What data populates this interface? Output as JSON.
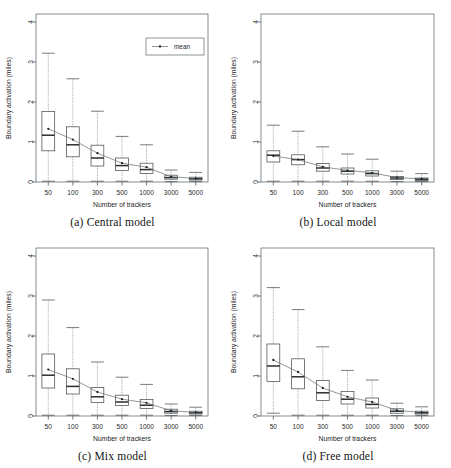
{
  "figure": {
    "panel_order": [
      "a",
      "b",
      "c",
      "d"
    ],
    "shared": {
      "xlabel": "Number of trackers",
      "ylabel": "Boundary activation (miles)",
      "xtick_labels": [
        "50",
        "100",
        "300",
        "500",
        "1000",
        "3000",
        "5000"
      ],
      "ytick_labels": [
        "0",
        "1",
        "2",
        "3",
        "4"
      ],
      "ylim": [
        0,
        4.2
      ],
      "legend_label": "mean",
      "grid": false,
      "legend_position": "top-right (panel a only)"
    }
  },
  "chart_data": [
    {
      "type": "box",
      "panel": "a",
      "title": "(a) Central model",
      "caption": "(a) Central model",
      "xlabel": "Number of trackers",
      "ylabel": "Boundary activation (miles)",
      "categories": [
        "50",
        "100",
        "300",
        "500",
        "1000",
        "3000",
        "5000"
      ],
      "ylim": [
        0,
        4.2
      ],
      "yticks": [
        0,
        1,
        2,
        3,
        4
      ],
      "grid": false,
      "legend": [
        "mean"
      ],
      "legend_position": "top-right",
      "boxes": [
        {
          "category": "50",
          "whisker_low": 0.02,
          "q1": 0.78,
          "median": 1.17,
          "q3": 1.76,
          "whisker_high": 3.22,
          "mean": 1.33
        },
        {
          "category": "100",
          "whisker_low": 0.02,
          "q1": 0.63,
          "median": 0.93,
          "q3": 1.38,
          "whisker_high": 2.58,
          "mean": 1.06
        },
        {
          "category": "300",
          "whisker_low": 0.02,
          "q1": 0.4,
          "median": 0.6,
          "q3": 0.92,
          "whisker_high": 1.77,
          "mean": 0.72
        },
        {
          "category": "500",
          "whisker_low": 0.02,
          "q1": 0.29,
          "median": 0.41,
          "q3": 0.6,
          "whisker_high": 1.14,
          "mean": 0.47
        },
        {
          "category": "1000",
          "whisker_low": 0.02,
          "q1": 0.21,
          "median": 0.31,
          "q3": 0.47,
          "whisker_high": 0.93,
          "mean": 0.37
        },
        {
          "category": "3000",
          "whisker_low": 0.01,
          "q1": 0.07,
          "median": 0.11,
          "q3": 0.17,
          "whisker_high": 0.3,
          "mean": 0.13
        },
        {
          "category": "5000",
          "whisker_low": 0.01,
          "q1": 0.05,
          "median": 0.08,
          "q3": 0.12,
          "whisker_high": 0.24,
          "mean": 0.09
        }
      ],
      "mean_series": {
        "name": "mean",
        "values": [
          1.33,
          1.06,
          0.72,
          0.47,
          0.37,
          0.13,
          0.09
        ]
      }
    },
    {
      "type": "box",
      "panel": "b",
      "title": "(b) Local model",
      "caption": "(b) Local model",
      "xlabel": "Number of trackers",
      "ylabel": "Boundary activation (miles)",
      "categories": [
        "50",
        "100",
        "300",
        "500",
        "1000",
        "3000",
        "5000"
      ],
      "ylim": [
        0,
        4.2
      ],
      "yticks": [
        0,
        1,
        2,
        3,
        4
      ],
      "grid": false,
      "legend": [],
      "boxes": [
        {
          "category": "50",
          "whisker_low": 0.02,
          "q1": 0.5,
          "median": 0.67,
          "q3": 0.78,
          "whisker_high": 1.42,
          "mean": 0.65
        },
        {
          "category": "100",
          "whisker_low": 0.02,
          "q1": 0.43,
          "median": 0.56,
          "q3": 0.68,
          "whisker_high": 1.27,
          "mean": 0.56
        },
        {
          "category": "300",
          "whisker_low": 0.02,
          "q1": 0.27,
          "median": 0.35,
          "q3": 0.46,
          "whisker_high": 0.88,
          "mean": 0.38
        },
        {
          "category": "500",
          "whisker_low": 0.02,
          "q1": 0.2,
          "median": 0.27,
          "q3": 0.35,
          "whisker_high": 0.7,
          "mean": 0.29
        },
        {
          "category": "1000",
          "whisker_low": 0.02,
          "q1": 0.15,
          "median": 0.21,
          "q3": 0.28,
          "whisker_high": 0.57,
          "mean": 0.23
        },
        {
          "category": "3000",
          "whisker_low": 0.01,
          "q1": 0.06,
          "median": 0.1,
          "q3": 0.14,
          "whisker_high": 0.27,
          "mean": 0.11
        },
        {
          "category": "5000",
          "whisker_low": 0.01,
          "q1": 0.04,
          "median": 0.07,
          "q3": 0.1,
          "whisker_high": 0.21,
          "mean": 0.08
        }
      ],
      "mean_series": {
        "name": "mean",
        "values": [
          0.65,
          0.56,
          0.38,
          0.29,
          0.23,
          0.11,
          0.08
        ]
      }
    },
    {
      "type": "box",
      "panel": "c",
      "title": "(c) Mix model",
      "caption": "(c) Mix model",
      "xlabel": "Number of trackers",
      "ylabel": "Boundary activation (miles)",
      "categories": [
        "50",
        "100",
        "300",
        "500",
        "1000",
        "3000",
        "5000"
      ],
      "ylim": [
        0,
        4.2
      ],
      "yticks": [
        0,
        1,
        2,
        3,
        4
      ],
      "grid": false,
      "legend": [],
      "boxes": [
        {
          "category": "50",
          "whisker_low": 0.02,
          "q1": 0.7,
          "median": 1.02,
          "q3": 1.55,
          "whisker_high": 2.9,
          "mean": 1.16
        },
        {
          "category": "100",
          "whisker_low": 0.02,
          "q1": 0.55,
          "median": 0.74,
          "q3": 1.18,
          "whisker_high": 2.21,
          "mean": 0.93
        },
        {
          "category": "300",
          "whisker_low": 0.02,
          "q1": 0.34,
          "median": 0.48,
          "q3": 0.71,
          "whisker_high": 1.35,
          "mean": 0.6
        },
        {
          "category": "500",
          "whisker_low": 0.02,
          "q1": 0.26,
          "median": 0.35,
          "q3": 0.52,
          "whisker_high": 0.97,
          "mean": 0.42
        },
        {
          "category": "1000",
          "whisker_low": 0.02,
          "q1": 0.19,
          "median": 0.27,
          "q3": 0.41,
          "whisker_high": 0.79,
          "mean": 0.33
        },
        {
          "category": "3000",
          "whisker_low": 0.01,
          "q1": 0.07,
          "median": 0.11,
          "q3": 0.17,
          "whisker_high": 0.3,
          "mean": 0.13
        },
        {
          "category": "5000",
          "whisker_low": 0.01,
          "q1": 0.05,
          "median": 0.08,
          "q3": 0.12,
          "whisker_high": 0.22,
          "mean": 0.09
        }
      ],
      "mean_series": {
        "name": "mean",
        "values": [
          1.16,
          0.93,
          0.6,
          0.42,
          0.33,
          0.13,
          0.09
        ]
      }
    },
    {
      "type": "box",
      "panel": "d",
      "title": "(d) Free model",
      "caption": "(d) Free model",
      "xlabel": "Number of trackers",
      "ylabel": "Boundary activation (miles)",
      "categories": [
        "50",
        "100",
        "300",
        "500",
        "1000",
        "3000",
        "5000"
      ],
      "ylim": [
        0,
        4.2
      ],
      "yticks": [
        0,
        1,
        2,
        3,
        4
      ],
      "grid": false,
      "legend": [],
      "boxes": [
        {
          "category": "50",
          "whisker_low": 0.07,
          "q1": 0.86,
          "median": 1.25,
          "q3": 1.8,
          "whisker_high": 3.21,
          "mean": 1.4
        },
        {
          "category": "100",
          "whisker_low": 0.02,
          "q1": 0.68,
          "median": 0.98,
          "q3": 1.43,
          "whisker_high": 2.66,
          "mean": 1.1
        },
        {
          "category": "300",
          "whisker_low": 0.02,
          "q1": 0.39,
          "median": 0.58,
          "q3": 0.89,
          "whisker_high": 1.73,
          "mean": 0.7
        },
        {
          "category": "500",
          "whisker_low": 0.02,
          "q1": 0.3,
          "median": 0.42,
          "q3": 0.61,
          "whisker_high": 1.14,
          "mean": 0.48
        },
        {
          "category": "1000",
          "whisker_low": 0.02,
          "q1": 0.2,
          "median": 0.29,
          "q3": 0.45,
          "whisker_high": 0.9,
          "mean": 0.35
        },
        {
          "category": "3000",
          "whisker_low": 0.01,
          "q1": 0.07,
          "median": 0.12,
          "q3": 0.18,
          "whisker_high": 0.32,
          "mean": 0.14
        },
        {
          "category": "5000",
          "whisker_low": 0.01,
          "q1": 0.05,
          "median": 0.08,
          "q3": 0.12,
          "whisker_high": 0.23,
          "mean": 0.09
        }
      ],
      "mean_series": {
        "name": "mean",
        "values": [
          1.4,
          1.1,
          0.7,
          0.48,
          0.35,
          0.14,
          0.09
        ]
      }
    }
  ]
}
